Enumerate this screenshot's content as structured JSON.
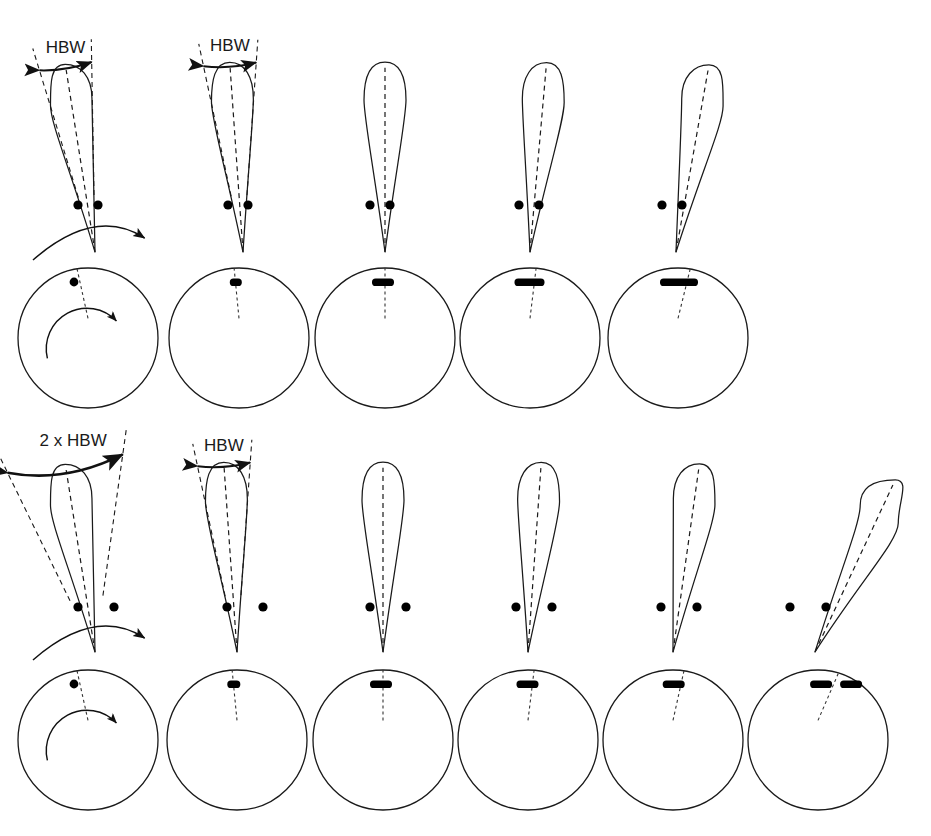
{
  "figure": {
    "type": "diagram",
    "width": 931,
    "height": 836,
    "background": "#ffffff",
    "stroke_color": "#1a1a1a",
    "dot_color": "#000000"
  },
  "labels": {
    "hbw": "HBW",
    "two_hbw": "2 x HBW"
  },
  "scenarios": [
    {
      "id": "unresolved",
      "name": "targets-separated-by-one-beamwidth",
      "label": "HBW",
      "target_separation_px": 20,
      "beam_row_y": 40,
      "scope_row_y": 268,
      "columns": 5,
      "label_columns": [
        0,
        1
      ],
      "beams": [
        {
          "step": 1,
          "tilt_deg": -9,
          "apex_x": 95,
          "apex_y": 252,
          "length": 190,
          "scan_arrow": true,
          "guides": true,
          "label": "HBW"
        },
        {
          "step": 2,
          "tilt_deg": -4,
          "apex_x": 243,
          "apex_y": 252,
          "length": 190,
          "scan_arrow": false,
          "guides": true,
          "label": "HBW"
        },
        {
          "step": 3,
          "tilt_deg": 0,
          "apex_x": 385,
          "apex_y": 252,
          "length": 190,
          "scan_arrow": false,
          "guides": false,
          "label": ""
        },
        {
          "step": 4,
          "tilt_deg": 5,
          "apex_x": 530,
          "apex_y": 252,
          "length": 190,
          "scan_arrow": false,
          "guides": false,
          "label": ""
        },
        {
          "step": 5,
          "tilt_deg": 10,
          "apex_x": 676,
          "apex_y": 252,
          "length": 190,
          "scan_arrow": false,
          "guides": false,
          "label": ""
        }
      ],
      "targets": [
        {
          "step": 1,
          "dots": [
            {
              "x": 78,
              "y": 205
            },
            {
              "x": 98,
              "y": 205
            }
          ]
        },
        {
          "step": 2,
          "dots": [
            {
              "x": 228,
              "y": 205
            },
            {
              "x": 248,
              "y": 205
            }
          ]
        },
        {
          "step": 3,
          "dots": [
            {
              "x": 370,
              "y": 205
            },
            {
              "x": 390,
              "y": 205
            }
          ]
        },
        {
          "step": 4,
          "dots": [
            {
              "x": 519,
              "y": 205
            },
            {
              "x": 539,
              "y": 205
            }
          ]
        },
        {
          "step": 5,
          "dots": [
            {
              "x": 662,
              "y": 205
            },
            {
              "x": 682,
              "y": 205
            }
          ]
        }
      ],
      "scopes": [
        {
          "step": 1,
          "cx": 88,
          "cy": 338,
          "r": 70,
          "sweep_deg": -9,
          "blob_len": 0,
          "scan_arrow": true
        },
        {
          "step": 2,
          "cx": 239,
          "cy": 338,
          "r": 70,
          "sweep_deg": -4,
          "blob_len": 12,
          "scan_arrow": false
        },
        {
          "step": 3,
          "cx": 385,
          "cy": 338,
          "r": 70,
          "sweep_deg": 0,
          "blob_len": 22,
          "scan_arrow": false
        },
        {
          "step": 4,
          "cx": 530,
          "cy": 338,
          "r": 70,
          "sweep_deg": 5,
          "blob_len": 30,
          "scan_arrow": false
        },
        {
          "step": 5,
          "cx": 678,
          "cy": 338,
          "r": 70,
          "sweep_deg": 10,
          "blob_len": 38,
          "scan_arrow": false
        }
      ],
      "outcome": "single merged blip - targets not resolved"
    },
    {
      "id": "resolved",
      "name": "targets-separated-by-two-beamwidths",
      "label": "2 x HBW",
      "target_separation_px": 36,
      "beam_row_y": 440,
      "scope_row_y": 668,
      "columns": 6,
      "label_columns": [
        0,
        1
      ],
      "beams": [
        {
          "step": 1,
          "tilt_deg": -9,
          "apex_x": 95,
          "apex_y": 652,
          "length": 190,
          "scan_arrow": true,
          "guides": true,
          "label": "2 x HBW"
        },
        {
          "step": 2,
          "tilt_deg": -4,
          "apex_x": 237,
          "apex_y": 652,
          "length": 190,
          "scan_arrow": false,
          "guides": true,
          "label": "HBW"
        },
        {
          "step": 3,
          "tilt_deg": 0,
          "apex_x": 383,
          "apex_y": 652,
          "length": 190,
          "scan_arrow": false,
          "guides": false,
          "label": ""
        },
        {
          "step": 4,
          "tilt_deg": 4,
          "apex_x": 528,
          "apex_y": 652,
          "length": 190,
          "scan_arrow": false,
          "guides": false,
          "label": ""
        },
        {
          "step": 5,
          "tilt_deg": 8,
          "apex_x": 673,
          "apex_y": 652,
          "length": 190,
          "scan_arrow": false,
          "guides": false,
          "label": ""
        },
        {
          "step": 6,
          "tilt_deg": 25,
          "apex_x": 815,
          "apex_y": 652,
          "length": 190,
          "scan_arrow": false,
          "guides": false,
          "label": ""
        }
      ],
      "targets": [
        {
          "step": 1,
          "dots": [
            {
              "x": 78,
              "y": 607
            },
            {
              "x": 114,
              "y": 607
            }
          ]
        },
        {
          "step": 2,
          "dots": [
            {
              "x": 227,
              "y": 607
            },
            {
              "x": 263,
              "y": 607
            }
          ]
        },
        {
          "step": 3,
          "dots": [
            {
              "x": 370,
              "y": 607
            },
            {
              "x": 406,
              "y": 607
            }
          ]
        },
        {
          "step": 4,
          "dots": [
            {
              "x": 516,
              "y": 607
            },
            {
              "x": 552,
              "y": 607
            }
          ]
        },
        {
          "step": 5,
          "dots": [
            {
              "x": 661,
              "y": 607
            },
            {
              "x": 697,
              "y": 607
            }
          ]
        },
        {
          "step": 6,
          "dots": [
            {
              "x": 790,
              "y": 607
            },
            {
              "x": 826,
              "y": 607
            }
          ]
        }
      ],
      "scopes": [
        {
          "step": 1,
          "cx": 88,
          "cy": 740,
          "r": 70,
          "sweep_deg": -9,
          "blob_len": 0,
          "scan_arrow": true,
          "second_blob": false
        },
        {
          "step": 2,
          "cx": 237,
          "cy": 740,
          "r": 70,
          "sweep_deg": -4,
          "blob_len": 13,
          "scan_arrow": false,
          "second_blob": false
        },
        {
          "step": 3,
          "cx": 383,
          "cy": 740,
          "r": 70,
          "sweep_deg": 0,
          "blob_len": 22,
          "scan_arrow": false,
          "second_blob": false
        },
        {
          "step": 4,
          "cx": 528,
          "cy": 740,
          "r": 70,
          "sweep_deg": 5,
          "blob_len": 22,
          "scan_arrow": false,
          "second_blob": false
        },
        {
          "step": 5,
          "cx": 673,
          "cy": 740,
          "r": 70,
          "sweep_deg": 9,
          "blob_len": 22,
          "scan_arrow": false,
          "second_blob": false
        },
        {
          "step": 6,
          "cx": 818,
          "cy": 740,
          "r": 70,
          "sweep_deg": 17,
          "blob_len": 22,
          "scan_arrow": false,
          "second_blob": true
        }
      ],
      "outcome": "two separate blips - targets resolved"
    }
  ]
}
